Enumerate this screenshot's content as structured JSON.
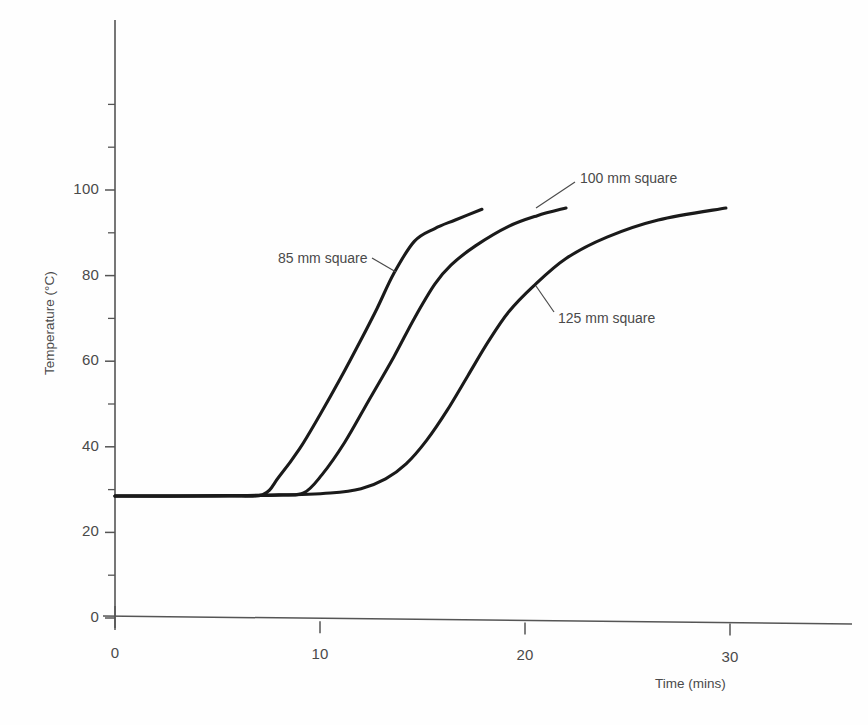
{
  "chart_data": {
    "type": "line",
    "title": "",
    "xlabel": "Time (mins)",
    "ylabel": "Temperature (°C)",
    "xlim": [
      0,
      34
    ],
    "ylim": [
      0,
      140
    ],
    "grid": false,
    "legend_position": "inline-annotations",
    "x_ticks": [
      0,
      10,
      20,
      30
    ],
    "x_tick_labels": [
      "0",
      "10",
      "20",
      "30"
    ],
    "y_ticks": [
      0,
      20,
      40,
      60,
      80,
      100
    ],
    "y_tick_labels": [
      "0",
      "20",
      "40",
      "60",
      "80",
      "100"
    ],
    "y_minor_ticks": [
      10,
      30,
      50,
      70,
      90,
      110,
      120
    ],
    "line_color": "#1a1a1a",
    "axis_color": "#555555",
    "series": [
      {
        "name": "85 mm square",
        "label": "85 mm square",
        "x": [
          0.0,
          3.0,
          5.5,
          7.2,
          8.0,
          9.0,
          10.0,
          11.0,
          12.0,
          12.8,
          13.6,
          14.6,
          15.6,
          16.6,
          17.9
        ],
        "y": [
          28.5,
          28.5,
          28.6,
          28.8,
          33.0,
          39.5,
          47.5,
          56.0,
          65.0,
          72.5,
          80.5,
          88.0,
          91.0,
          93.0,
          95.5
        ]
      },
      {
        "name": "100 mm square",
        "label": "100 mm square",
        "x": [
          0.0,
          3.0,
          6.0,
          8.0,
          9.2,
          10.1,
          11.2,
          12.4,
          13.6,
          14.6,
          15.6,
          16.4,
          17.6,
          19.2,
          20.6,
          22.0
        ],
        "y": [
          28.5,
          28.5,
          28.6,
          28.8,
          29.2,
          33.5,
          41.0,
          51.0,
          61.0,
          70.0,
          78.0,
          82.5,
          87.0,
          91.5,
          94.0,
          95.8
        ]
      },
      {
        "name": "125 mm square",
        "label": "125 mm square",
        "x": [
          0.0,
          4.0,
          8.0,
          10.5,
          12.0,
          13.2,
          14.2,
          15.2,
          16.2,
          17.2,
          18.2,
          19.2,
          20.4,
          22.0,
          24.0,
          26.5,
          29.8
        ],
        "y": [
          28.5,
          28.5,
          28.7,
          29.2,
          30.2,
          32.5,
          36.0,
          41.5,
          48.5,
          56.5,
          64.5,
          71.5,
          77.5,
          84.0,
          89.0,
          93.0,
          95.8
        ]
      }
    ],
    "annotations": [
      {
        "name": "85 mm square",
        "text": "85 mm square",
        "label_x": 278,
        "label_y": 250,
        "leader_from_x": 372,
        "leader_from_y": 258,
        "leader_to_x": 396,
        "leader_to_y": 272
      },
      {
        "name": "100 mm square",
        "text": "100 mm square",
        "label_x": 580,
        "label_y": 170,
        "leader_from_x": 575,
        "leader_from_y": 182,
        "leader_to_x": 536,
        "leader_to_y": 208
      },
      {
        "name": "125 mm square",
        "text": "125 mm square",
        "label_x": 558,
        "label_y": 310,
        "leader_from_x": 554,
        "leader_from_y": 312,
        "leader_to_x": 536,
        "leader_to_y": 286
      }
    ]
  }
}
